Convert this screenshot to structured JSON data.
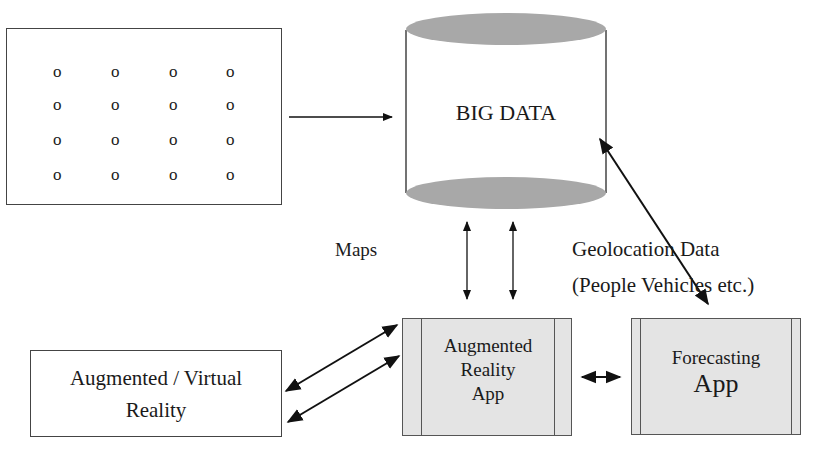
{
  "diagram": {
    "sensor_grid": {
      "rows": 4,
      "cols": 4,
      "symbol": "o"
    },
    "big_data": {
      "label": "BIG DATA",
      "shape": "cylinder",
      "cap_color": "#a8a8a8"
    },
    "maps_label": "Maps",
    "geolocation": {
      "line1": "Geolocation Data",
      "line2": "(People Vehicles etc.)"
    },
    "ar_app": {
      "line1": "Augmented",
      "line2": "Reality",
      "line3": "App"
    },
    "forecasting_app": {
      "line1": "Forecasting",
      "line2": "App"
    },
    "av_reality": {
      "line1": "Augmented / Virtual",
      "line2": "Reality"
    },
    "colors": {
      "shaded_box": "#e4e4e4",
      "line": "#111111"
    }
  }
}
